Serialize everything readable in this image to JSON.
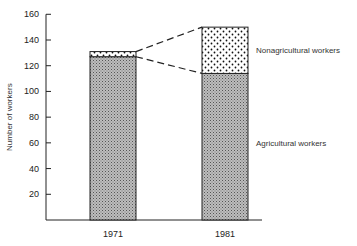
{
  "chart_data": {
    "type": "bar",
    "stacked": true,
    "title": "",
    "xlabel": "",
    "ylabel": "Number of workers",
    "ylim": [
      0,
      160
    ],
    "yticks": [
      20,
      40,
      60,
      80,
      100,
      120,
      140,
      160
    ],
    "categories": [
      "1971",
      "1981"
    ],
    "series": [
      {
        "name": "Agricultural workers",
        "values": [
          127,
          114
        ],
        "pattern": "fine-crosshatch"
      },
      {
        "name": "Nonagricultural workers",
        "values": [
          4,
          36
        ],
        "pattern": "dots"
      }
    ],
    "annotations": [
      "dashed connector lines between the two bars' nonagricultural segments"
    ],
    "grid": false,
    "legend_position": "right, inline labels"
  }
}
